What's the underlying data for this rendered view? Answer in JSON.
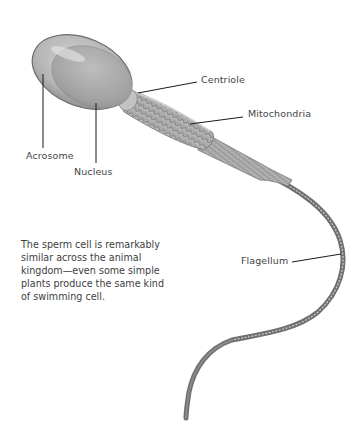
{
  "diagram": {
    "subject": "Sperm cell",
    "labels": {
      "centriole": "Centriole",
      "mitochondria": "Mitochondria",
      "acrosome": "Acrosome",
      "nucleus": "Nucleus",
      "flagellum": "Flagellum"
    },
    "caption": "The sperm cell is remarkably similar across the animal kingdom—even some simple plants produce the same kind of swimming cell.",
    "colors": {
      "background": "#ffffff",
      "cell_body": "#a8a8a8",
      "cell_outline": "#6e6e6e",
      "leader_lines": "#1a1a1a",
      "label_text": "#444444"
    }
  }
}
